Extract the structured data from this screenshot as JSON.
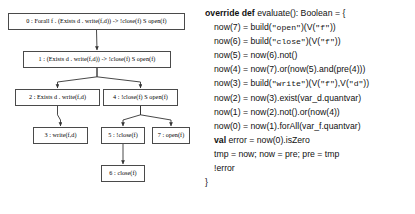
{
  "diagram": {
    "nodes": [
      {
        "id": "0",
        "label": "0 : Forall f . (Exists d . write(f,d)) -> !close(f) S open(f)",
        "x": 8,
        "y": 13,
        "w": 177,
        "h": 17
      },
      {
        "id": "1",
        "label": "1 : (Exists d . write(f,d)) -> !close(f) S open(f)",
        "x": 23,
        "y": 51,
        "w": 148,
        "h": 17
      },
      {
        "id": "2",
        "label": "2 : Exists d . write(f,d)",
        "x": 15,
        "y": 89,
        "w": 85,
        "h": 17
      },
      {
        "id": "4",
        "label": "4 : !close(f) S open(f)",
        "x": 103,
        "y": 89,
        "w": 75,
        "h": 17
      },
      {
        "id": "3",
        "label": "3 : write(f,d)",
        "x": 33,
        "y": 127,
        "w": 55,
        "h": 17
      },
      {
        "id": "5",
        "label": "5 : !close(f)",
        "x": 101,
        "y": 127,
        "w": 44,
        "h": 17
      },
      {
        "id": "7",
        "label": "7 : open(f)",
        "x": 152,
        "y": 127,
        "w": 38,
        "h": 17
      },
      {
        "id": "6",
        "label": "6 : close(f)",
        "x": 101,
        "y": 165,
        "w": 44,
        "h": 17
      }
    ],
    "edges": [
      {
        "from": "0",
        "to": "1"
      },
      {
        "from": "1",
        "to": "2"
      },
      {
        "from": "1",
        "to": "4"
      },
      {
        "from": "2",
        "to": "3"
      },
      {
        "from": "4",
        "to": "5"
      },
      {
        "from": "4",
        "to": "7"
      },
      {
        "from": "5",
        "to": "6"
      }
    ],
    "edge_color": "#333333",
    "node_border_color": "#4a4a4a"
  },
  "code": {
    "language": "scala",
    "lines": [
      {
        "indent": 0,
        "parts": [
          {
            "t": "override def",
            "s": "kw"
          },
          {
            "t": " evaluate(): Boolean = {",
            "s": "plain"
          }
        ]
      },
      {
        "indent": 1,
        "parts": [
          {
            "t": "now(7) = build(",
            "s": "plain"
          },
          {
            "t": "\"open\"",
            "s": "str"
          },
          {
            "t": ")(V(",
            "s": "plain"
          },
          {
            "t": "\"f\"",
            "s": "str"
          },
          {
            "t": "))",
            "s": "plain"
          }
        ]
      },
      {
        "indent": 1,
        "parts": [
          {
            "t": "now(6) = build(",
            "s": "plain"
          },
          {
            "t": "\"close\"",
            "s": "str"
          },
          {
            "t": ")(V(",
            "s": "plain"
          },
          {
            "t": "\"f\"",
            "s": "str"
          },
          {
            "t": "))",
            "s": "plain"
          }
        ]
      },
      {
        "indent": 1,
        "parts": [
          {
            "t": "now(5) = now(6).not()",
            "s": "plain"
          }
        ]
      },
      {
        "indent": 1,
        "parts": [
          {
            "t": "now(4) = now(7).or(now(5).and(pre(4)))",
            "s": "plain"
          }
        ]
      },
      {
        "indent": 1,
        "parts": [
          {
            "t": "now(3) = build(",
            "s": "plain"
          },
          {
            "t": "\"write\"",
            "s": "str"
          },
          {
            "t": ")(V(",
            "s": "plain"
          },
          {
            "t": "\"f\"",
            "s": "str"
          },
          {
            "t": "),V(",
            "s": "plain"
          },
          {
            "t": "\"d\"",
            "s": "str"
          },
          {
            "t": "))",
            "s": "plain"
          }
        ]
      },
      {
        "indent": 1,
        "parts": [
          {
            "t": "now(2) = now(3).exist(var_d.quantvar)",
            "s": "plain"
          }
        ]
      },
      {
        "indent": 1,
        "parts": [
          {
            "t": "now(1) = now(2).not().or(now(4))",
            "s": "plain"
          }
        ]
      },
      {
        "indent": 1,
        "parts": [
          {
            "t": "now(0) = now(1).forAll(var_f.quantvar)",
            "s": "plain"
          }
        ]
      },
      {
        "indent": 1,
        "parts": [
          {
            "t": "val",
            "s": "kw"
          },
          {
            "t": " error = now(0).isZero",
            "s": "plain"
          }
        ]
      },
      {
        "indent": 1,
        "parts": [
          {
            "t": "tmp = now; now = pre; pre = tmp",
            "s": "plain"
          }
        ]
      },
      {
        "indent": 1,
        "parts": [
          {
            "t": "!error",
            "s": "plain"
          }
        ]
      },
      {
        "indent": 0,
        "parts": [
          {
            "t": "}",
            "s": "plain"
          }
        ]
      }
    ]
  }
}
